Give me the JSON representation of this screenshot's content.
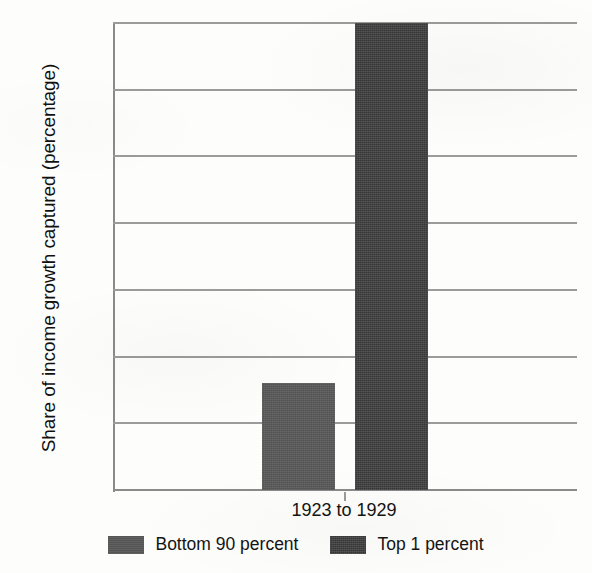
{
  "chart_data": {
    "type": "bar",
    "title": "",
    "xlabel": "",
    "ylabel": "Share of income growth captured (percentage)",
    "categories": [
      "1923 to 1929"
    ],
    "series": [
      {
        "name": "Bottom 90 percent",
        "values": [
          16
        ],
        "color": "#585858"
      },
      {
        "name": "Top 1 percent",
        "values": [
          70
        ],
        "color": "#3c3c3c"
      }
    ],
    "ylim": [
      0,
      70
    ],
    "y_ticks": [
      10,
      20,
      30,
      40,
      50,
      60,
      70
    ],
    "y_tick_labels": [
      "10",
      "20",
      "30",
      "40",
      "50",
      "60",
      "70%"
    ],
    "grid": "horizontal",
    "legend_position": "bottom"
  },
  "axes": {
    "y_title": "Share of income growth captured (percentage)",
    "x_category": "1923 to 1929"
  },
  "legend": {
    "entries": [
      {
        "label": "Bottom 90 percent"
      },
      {
        "label": "Top 1 percent"
      }
    ]
  }
}
